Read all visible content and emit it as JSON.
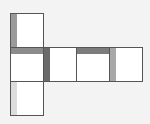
{
  "diagram": {
    "type": "cube-net",
    "background": "#f3f3f3",
    "faces": [
      {
        "id": "top",
        "x": 10,
        "y": 13,
        "w": 34,
        "h": 35,
        "shade_side": "left",
        "shade_color": "#9a9a9a"
      },
      {
        "id": "middle-1",
        "x": 10,
        "y": 47,
        "w": 34,
        "h": 35,
        "shade_side": "top",
        "shade_color": "#8c8c8c"
      },
      {
        "id": "middle-2",
        "x": 43,
        "y": 47,
        "w": 34,
        "h": 35,
        "shade_side": "left",
        "shade_color": "#6a6a6a"
      },
      {
        "id": "middle-3",
        "x": 76,
        "y": 47,
        "w": 34,
        "h": 35,
        "shade_side": "top",
        "shade_color": "#7c7c7c"
      },
      {
        "id": "middle-4",
        "x": 109,
        "y": 47,
        "w": 34,
        "h": 35,
        "shade_side": "left",
        "shade_color": "#a8a8a8"
      },
      {
        "id": "bottom",
        "x": 10,
        "y": 81,
        "w": 34,
        "h": 35,
        "shade_side": "left",
        "shade_color": "#dcdcdc"
      }
    ]
  }
}
